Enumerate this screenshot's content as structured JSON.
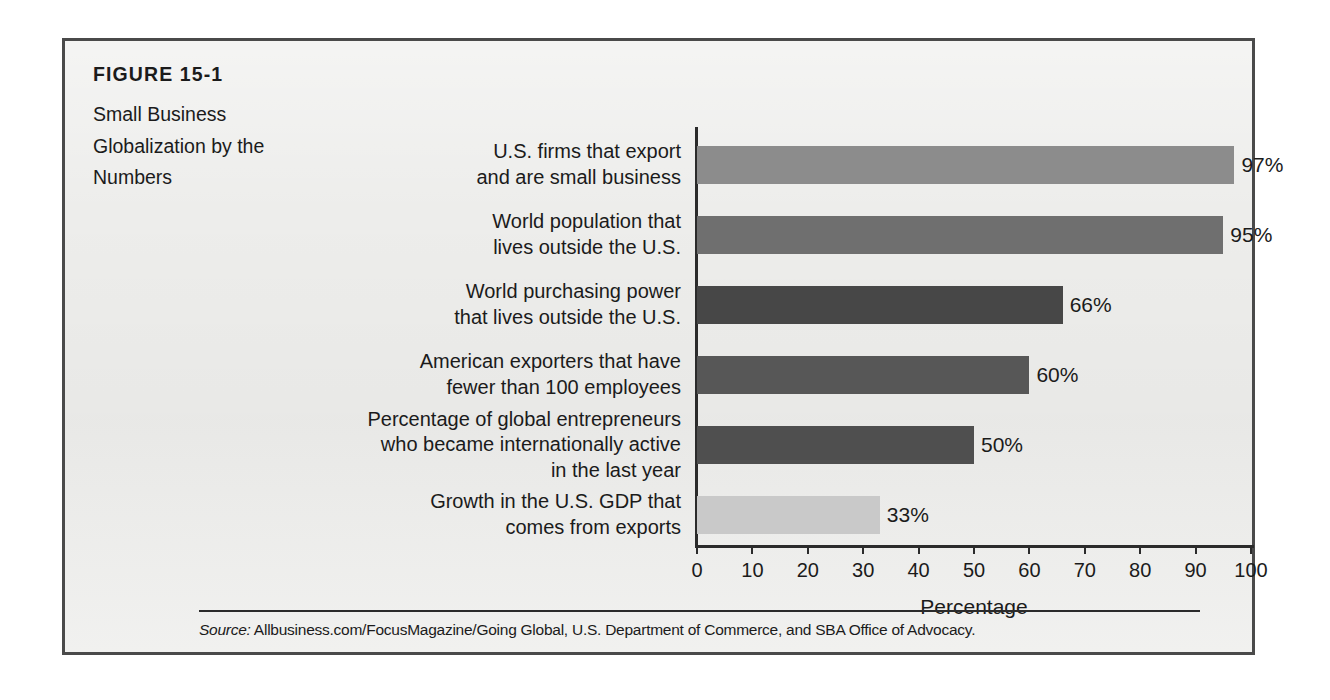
{
  "figure": {
    "number": "FIGURE 15-1",
    "title": "Small Business\nGlobalization by the\nNumbers",
    "source_lead": "Source:",
    "source_text": " Allbusiness.com/FocusMagazine/Going Global, U.S. Department of Commerce, and SBA Office of Advocacy."
  },
  "colors": {
    "paper": "#ededeb",
    "frame_border": "#4a4a4a",
    "axis": "#2b2b2b",
    "text": "#1b1b1b",
    "bar_1": "#8c8c8c",
    "bar_2": "#6f6f6f",
    "bar_3": "#474747",
    "bar_4": "#575757",
    "bar_5": "#4f4f4f",
    "bar_6": "#c9c9c9"
  },
  "chart_data": {
    "type": "bar",
    "orientation": "horizontal",
    "title": "Small Business Globalization by the Numbers",
    "xlabel": "Percentage",
    "ylabel": "",
    "xlim": [
      0,
      100
    ],
    "grid": false,
    "legend": null,
    "tick_labels": [
      "0",
      "10",
      "20",
      "30",
      "40",
      "50",
      "60",
      "70",
      "80",
      "90",
      "100"
    ],
    "ticks": [
      0,
      10,
      20,
      30,
      40,
      50,
      60,
      70,
      80,
      90,
      100
    ],
    "categories": [
      "U.S. firms that export\nand are small business",
      "World population that\nlives outside the U.S.",
      "World purchasing power\nthat lives outside the U.S.",
      "American exporters that have\nfewer than 100 employees",
      "Percentage of global entrepreneurs\nwho became internationally active\nin the last year",
      "Growth in the U.S. GDP that\ncomes from exports"
    ],
    "values": [
      97,
      95,
      66,
      60,
      50,
      33
    ],
    "value_labels": [
      "97%",
      "95%",
      "66%",
      "60%",
      "50%",
      "33%"
    ],
    "bar_colors": [
      "#8c8c8c",
      "#6f6f6f",
      "#474747",
      "#575757",
      "#4f4f4f",
      "#c9c9c9"
    ]
  }
}
